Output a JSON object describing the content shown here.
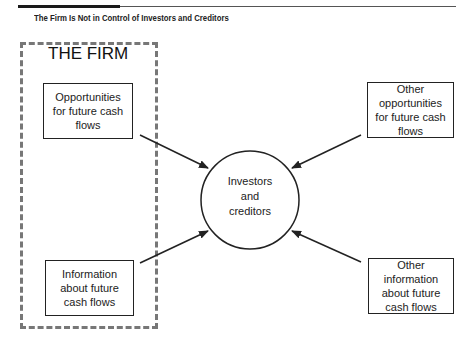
{
  "caption": "The Firm Is Not in Control of Investors and Creditors",
  "firm": {
    "label": "THE FIRM",
    "boxes": [
      {
        "text": "Opportunities for future cash flows"
      },
      {
        "text": "Information about future cash flows"
      }
    ]
  },
  "center": {
    "text": "Investors and creditors"
  },
  "external": {
    "boxes": [
      {
        "text": "Other opportunities for future cash flows"
      },
      {
        "text": "Other information about future cash flows"
      }
    ]
  },
  "colors": {
    "line": "#222222",
    "dashed_border": "#777777"
  }
}
